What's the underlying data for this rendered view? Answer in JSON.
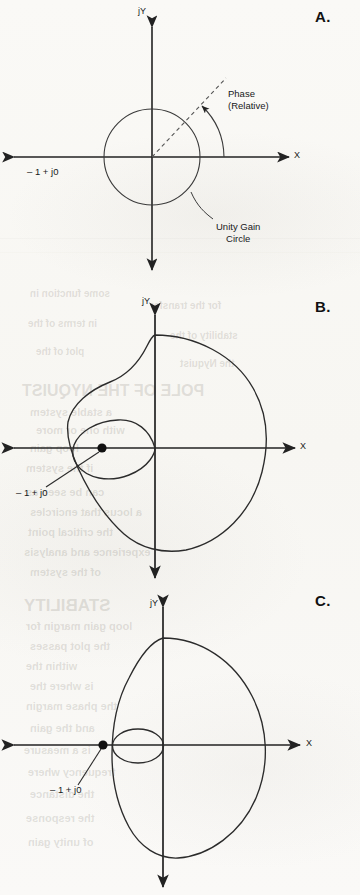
{
  "page": {
    "width": 360,
    "height": 895,
    "background_color": "#fbfaf8",
    "ink_color": "#1a1a1a"
  },
  "ghost_text": [
    {
      "text": "some function in",
      "x": 30,
      "y": 288,
      "size": 10
    },
    {
      "text": "for the transfer",
      "x": 150,
      "y": 300,
      "size": 10
    },
    {
      "text": "in terms of the",
      "x": 28,
      "y": 318,
      "size": 10
    },
    {
      "text": "stability of the",
      "x": 170,
      "y": 330,
      "size": 10
    },
    {
      "text": "plot of the",
      "x": 36,
      "y": 346,
      "size": 10
    },
    {
      "text": "the Nyquist",
      "x": 180,
      "y": 358,
      "size": 10
    },
    {
      "text": "POLE OF THE NYQUIST",
      "x": 22,
      "y": 382,
      "size": 16
    },
    {
      "text": "a stable system",
      "x": 30,
      "y": 406,
      "size": 11
    },
    {
      "text": "with one or more",
      "x": 36,
      "y": 424,
      "size": 11
    },
    {
      "text": "loop gain",
      "x": 30,
      "y": 442,
      "size": 11
    },
    {
      "text": "if the system",
      "x": 26,
      "y": 462,
      "size": 11
    },
    {
      "text": "can be seen as",
      "x": 26,
      "y": 486,
      "size": 11
    },
    {
      "text": "a locus that encircles",
      "x": 30,
      "y": 506,
      "size": 11
    },
    {
      "text": "the critical point",
      "x": 28,
      "y": 526,
      "size": 11
    },
    {
      "text": "experience and analysis",
      "x": 24,
      "y": 546,
      "size": 11
    },
    {
      "text": "of the system",
      "x": 30,
      "y": 566,
      "size": 11
    },
    {
      "text": "STABILITY",
      "x": 24,
      "y": 596,
      "size": 17
    },
    {
      "text": "loop gain margin for",
      "x": 26,
      "y": 620,
      "size": 11
    },
    {
      "text": "the plot passes",
      "x": 30,
      "y": 640,
      "size": 11
    },
    {
      "text": "within the",
      "x": 26,
      "y": 660,
      "size": 11
    },
    {
      "text": "is where the",
      "x": 30,
      "y": 680,
      "size": 11
    },
    {
      "text": "the phase margin",
      "x": 26,
      "y": 700,
      "size": 11
    },
    {
      "text": "and the gain",
      "x": 30,
      "y": 722,
      "size": 11
    },
    {
      "text": "is a measure",
      "x": 24,
      "y": 744,
      "size": 11
    },
    {
      "text": "frequency where",
      "x": 28,
      "y": 766,
      "size": 11
    },
    {
      "text": "the distance",
      "x": 30,
      "y": 788,
      "size": 11
    },
    {
      "text": "the response",
      "x": 26,
      "y": 812,
      "size": 11
    },
    {
      "text": "of unity gain",
      "x": 28,
      "y": 836,
      "size": 11
    }
  ],
  "scan_lines": [
    {
      "y": 238,
      "opacity": 0.2
    },
    {
      "y": 252,
      "opacity": 0.14
    }
  ],
  "panels": [
    {
      "id": "A",
      "letter": "A.",
      "letter_pos": {
        "x": 315,
        "y": 8
      },
      "caption": "Unity gain circle with relative phase angle",
      "axis_x_label": "X",
      "axis_y_label": "jY",
      "origin": {
        "x": 152,
        "y": 157
      },
      "labels": [
        {
          "name": "minus-one-plus-j0",
          "text": "– 1 + j0",
          "x": 27,
          "y": 166
        },
        {
          "name": "phase-relative",
          "text": "Phase\n(Relative)",
          "x": 228,
          "y": 88
        },
        {
          "name": "unity-gain-circle",
          "text": "Unity Gain\nCircle",
          "x": 216,
          "y": 221
        }
      ],
      "curve": {
        "type": "unity-gain-circle",
        "center": {
          "x": 152,
          "y": 157
        },
        "radius": 48
      },
      "phase_ray": {
        "angle_deg": 47,
        "length": 108,
        "style": "dashed"
      },
      "phase_arc": {
        "radius": 72,
        "from_deg": 0,
        "to_deg": 47
      }
    },
    {
      "id": "B",
      "letter": "B.",
      "letter_pos": {
        "x": 315,
        "y": 298
      },
      "caption": "Nyquist locus that encircles the critical point -1 + j0",
      "axis_x_label": "X",
      "axis_y_label": "jY",
      "origin": {
        "x": 155,
        "y": 448
      },
      "critical_point": {
        "x": 102,
        "y": 448,
        "label": "– 1 + j0"
      },
      "labels": [
        {
          "name": "minus-one-plus-j0",
          "text": "– 1 + j0",
          "x": 16,
          "y": 493
        }
      ],
      "curve": {
        "type": "nyquist-locus-with-inner-loop",
        "outer_extent": {
          "left": 63,
          "right": 268,
          "top": 335,
          "bottom": 550
        },
        "inner_loop_extent": {
          "left": 68,
          "right": 155,
          "top": 421,
          "bottom": 477
        }
      },
      "leader_line": {
        "from": {
          "x": 46,
          "y": 487
        },
        "to": {
          "x": 100,
          "y": 452
        }
      }
    },
    {
      "id": "C",
      "letter": "C.",
      "letter_pos": {
        "x": 315,
        "y": 592
      },
      "caption": "Nyquist locus with small inner loop, critical point outside the locus",
      "axis_x_label": "X",
      "axis_y_label": "jY",
      "origin": {
        "x": 163,
        "y": 745
      },
      "critical_point": {
        "x": 103,
        "y": 745,
        "label": "– 1 + j0"
      },
      "labels": [
        {
          "name": "minus-one-plus-j0",
          "text": "– 1 + j0",
          "x": 50,
          "y": 790
        }
      ],
      "curve": {
        "type": "nyquist-locus-with-small-inner-loop",
        "outer_extent": {
          "left": 110,
          "right": 268,
          "top": 638,
          "bottom": 858
        },
        "inner_loop_extent": {
          "left": 112,
          "right": 163,
          "top": 729,
          "bottom": 763
        }
      },
      "leader_line": {
        "from": {
          "x": 78,
          "y": 785
        },
        "to": {
          "x": 101,
          "y": 749
        }
      }
    }
  ],
  "chart_data": {
    "type": "line",
    "xlabel": "X",
    "ylabel": "jY",
    "grid": false,
    "legend": "none",
    "annotations": [
      "– 1 + j0",
      "Phase (Relative)",
      "Unity Gain Circle"
    ],
    "series": [
      {
        "name": "A: Unity gain circle",
        "panel": "A",
        "description": "Circle of radius 1 centred on the origin of the X / jY complex plane, with a dashed radial ray at about 47 degrees and a curved arrow showing relative phase",
        "points_polar_unit": [
          {
            "angle_deg": 0,
            "magnitude": 1
          },
          {
            "angle_deg": 45,
            "magnitude": 1
          },
          {
            "angle_deg": 90,
            "magnitude": 1
          },
          {
            "angle_deg": 135,
            "magnitude": 1
          },
          {
            "angle_deg": 180,
            "magnitude": 1
          },
          {
            "angle_deg": 225,
            "magnitude": 1
          },
          {
            "angle_deg": 270,
            "magnitude": 1
          },
          {
            "angle_deg": 315,
            "magnitude": 1
          }
        ]
      },
      {
        "name": "B: Locus encircling -1 + j0",
        "panel": "B",
        "description": "Large closed locus extending to about +2.1 on X and a large inner loop that encloses the critical point at -1 + j0",
        "outer_polar": [
          {
            "angle_deg": 0,
            "magnitude": 2.1
          },
          {
            "angle_deg": 30,
            "magnitude": 2.0
          },
          {
            "angle_deg": 60,
            "magnitude": 1.8
          },
          {
            "angle_deg": 90,
            "magnitude": 1.55
          },
          {
            "angle_deg": 120,
            "magnitude": 1.6
          },
          {
            "angle_deg": 150,
            "magnitude": 1.75
          },
          {
            "angle_deg": 180,
            "magnitude": 1.7
          },
          {
            "angle_deg": 210,
            "magnitude": 1.75
          },
          {
            "angle_deg": 240,
            "magnitude": 1.8
          },
          {
            "angle_deg": 270,
            "magnitude": 1.9
          },
          {
            "angle_deg": 300,
            "magnitude": 2.0
          },
          {
            "angle_deg": 330,
            "magnitude": 2.05
          }
        ],
        "inner_loop_polar": [
          {
            "angle_deg": 180,
            "magnitude": 1.62
          },
          {
            "angle_deg": 200,
            "magnitude": 1.45
          },
          {
            "angle_deg": 240,
            "magnitude": 0.9
          },
          {
            "angle_deg": 280,
            "magnitude": 0.3
          },
          {
            "angle_deg": 320,
            "magnitude": 0.05
          }
        ]
      },
      {
        "name": "C: Locus not encircling -1 + j0",
        "panel": "C",
        "description": "Large closed locus extending to about +2.0 on X with a small inner loop reaching only to about -0.95, leaving the critical point outside",
        "outer_polar": [
          {
            "angle_deg": 0,
            "magnitude": 2.0
          },
          {
            "angle_deg": 30,
            "magnitude": 1.95
          },
          {
            "angle_deg": 60,
            "magnitude": 1.8
          },
          {
            "angle_deg": 90,
            "magnitude": 1.95
          },
          {
            "angle_deg": 120,
            "magnitude": 1.7
          },
          {
            "angle_deg": 150,
            "magnitude": 1.2
          },
          {
            "angle_deg": 180,
            "magnitude": 0.98
          },
          {
            "angle_deg": 210,
            "magnitude": 1.2
          },
          {
            "angle_deg": 240,
            "magnitude": 1.7
          },
          {
            "angle_deg": 270,
            "magnitude": 1.95
          },
          {
            "angle_deg": 300,
            "magnitude": 1.9
          },
          {
            "angle_deg": 330,
            "magnitude": 1.95
          }
        ],
        "inner_loop_polar": [
          {
            "angle_deg": 180,
            "magnitude": 0.92
          },
          {
            "angle_deg": 225,
            "magnitude": 0.6
          },
          {
            "angle_deg": 270,
            "magnitude": 0.3
          },
          {
            "angle_deg": 315,
            "magnitude": 0.1
          }
        ]
      }
    ]
  }
}
